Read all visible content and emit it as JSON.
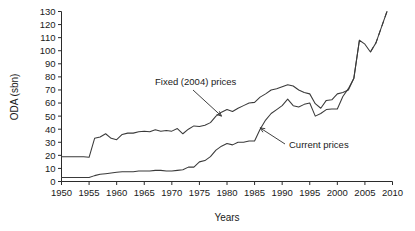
{
  "chart_data": {
    "type": "line",
    "title": "",
    "xlabel": "Years",
    "ylabel": "ODA (sbn)",
    "xlim": [
      1950,
      2010
    ],
    "ylim": [
      0,
      130
    ],
    "grid": false,
    "legend_position": "inline-annotations",
    "xticks": [
      1950,
      1955,
      1960,
      1965,
      1970,
      1975,
      1980,
      1985,
      1990,
      1995,
      2000,
      2005,
      2010
    ],
    "yticks": [
      0,
      10,
      20,
      30,
      40,
      50,
      60,
      70,
      80,
      90,
      100,
      110,
      120,
      130
    ],
    "annotations": [
      {
        "label": "Fixed (2004) prices",
        "target_year": 1979,
        "target_value": 50
      },
      {
        "label": "Current prices",
        "target_year": 1986,
        "target_value": 41
      }
    ],
    "series": [
      {
        "name": "Fixed (2004) prices",
        "style": "solid",
        "x": [
          1950,
          1951,
          1952,
          1953,
          1954,
          1955,
          1956,
          1957,
          1958,
          1959,
          1960,
          1961,
          1962,
          1963,
          1964,
          1965,
          1966,
          1967,
          1968,
          1969,
          1970,
          1971,
          1972,
          1973,
          1974,
          1975,
          1976,
          1977,
          1978,
          1979,
          1980,
          1981,
          1982,
          1983,
          1984,
          1985,
          1986,
          1987,
          1988,
          1989,
          1990,
          1991,
          1992,
          1993,
          1994,
          1995,
          1996,
          1997,
          1998,
          1999,
          2000,
          2001,
          2002,
          2003,
          2004,
          2005,
          2006,
          2007,
          2008,
          2009
        ],
        "values": [
          19,
          19,
          19,
          19,
          19,
          18.5,
          33,
          34,
          36.5,
          33,
          32,
          36,
          37,
          37,
          38,
          38.5,
          38,
          39.5,
          38.5,
          39,
          38.5,
          40.5,
          36.5,
          40,
          42.5,
          42,
          43,
          45,
          50,
          53,
          55,
          53.5,
          56,
          58,
          60,
          60.5,
          64.5,
          67,
          70,
          71,
          72.5,
          74,
          73,
          70,
          68,
          67,
          59.5,
          56,
          62,
          62.5,
          67,
          68,
          70,
          79,
          108,
          105,
          99,
          106,
          118,
          130
        ]
      },
      {
        "name": "Current prices",
        "style": "solid",
        "x": [
          1950,
          1951,
          1952,
          1953,
          1954,
          1955,
          1956,
          1957,
          1958,
          1959,
          1960,
          1961,
          1962,
          1963,
          1964,
          1965,
          1966,
          1967,
          1968,
          1969,
          1970,
          1971,
          1972,
          1973,
          1974,
          1975,
          1976,
          1977,
          1978,
          1979,
          1980,
          1981,
          1982,
          1983,
          1984,
          1985,
          1986,
          1987,
          1988,
          1989,
          1990,
          1991,
          1992,
          1993,
          1994,
          1995,
          1996,
          1997,
          1998,
          1999,
          2000,
          2001,
          2002,
          2003,
          2004
        ],
        "values": [
          3,
          3,
          3,
          3,
          3,
          3,
          4.5,
          5.5,
          6,
          6.5,
          7,
          7.5,
          7.5,
          7.5,
          8,
          8,
          8,
          8.5,
          8.5,
          8,
          8,
          8.5,
          9,
          11,
          11,
          15,
          16,
          19,
          24,
          27,
          29,
          28,
          30,
          30,
          31,
          31,
          40,
          47,
          52,
          55,
          58,
          63,
          58,
          57,
          59,
          60,
          50,
          52,
          55,
          55.5,
          55.5,
          65,
          71,
          79,
          108
        ]
      }
    ],
    "dashed_projection": {
      "name": "Fixed (2004) prices projection",
      "style": "dashed",
      "x": [
        2006,
        2007,
        2008,
        2009
      ],
      "values": [
        99,
        106,
        118,
        130
      ]
    }
  }
}
